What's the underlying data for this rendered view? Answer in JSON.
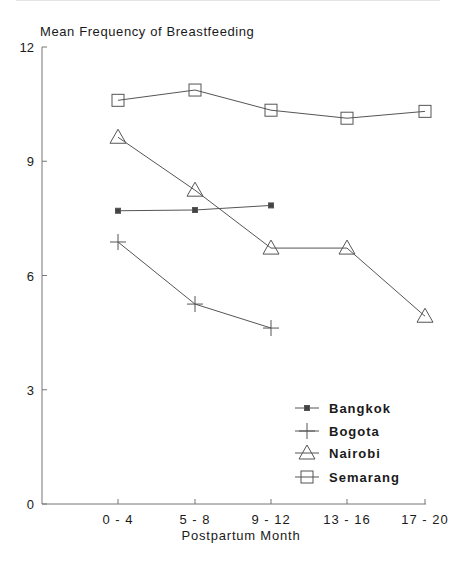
{
  "chart_data": {
    "type": "line",
    "title": "Mean Frequency of Breastfeeding",
    "xlabel": "Postpartum Month",
    "ylabel": "Mean Frequency of Breastfeeding",
    "categories": [
      "0-4",
      "5-8",
      "9-12",
      "13-16",
      "17-20"
    ],
    "ylim": [
      0,
      12
    ],
    "yticks": [
      0,
      3,
      6,
      9,
      12
    ],
    "grid": false,
    "legend_position": "lower right",
    "series": [
      {
        "name": "Bangkok",
        "marker": "small-filled-square",
        "values": [
          7.7,
          7.72,
          7.84,
          null,
          null
        ]
      },
      {
        "name": "Bogota",
        "marker": "plus",
        "values": [
          6.88,
          5.25,
          4.62,
          null,
          null
        ]
      },
      {
        "name": "Nairobi",
        "marker": "triangle",
        "values": [
          9.63,
          8.24,
          6.72,
          6.72,
          4.93
        ]
      },
      {
        "name": "Semarang",
        "marker": "square",
        "values": [
          10.6,
          10.87,
          10.34,
          10.13,
          10.31
        ]
      }
    ]
  },
  "labels": {
    "title": "Mean Frequency of Breastfeeding",
    "xlabel": "Postpartum Month",
    "yticks": [
      "12",
      "9",
      "6",
      "3",
      "0"
    ],
    "xticks": [
      "0-4",
      "5-8",
      "9-12",
      "13-16",
      "17-20"
    ],
    "legend": [
      "Bangkok",
      "Bogota",
      "Nairobi",
      "Semarang"
    ]
  }
}
